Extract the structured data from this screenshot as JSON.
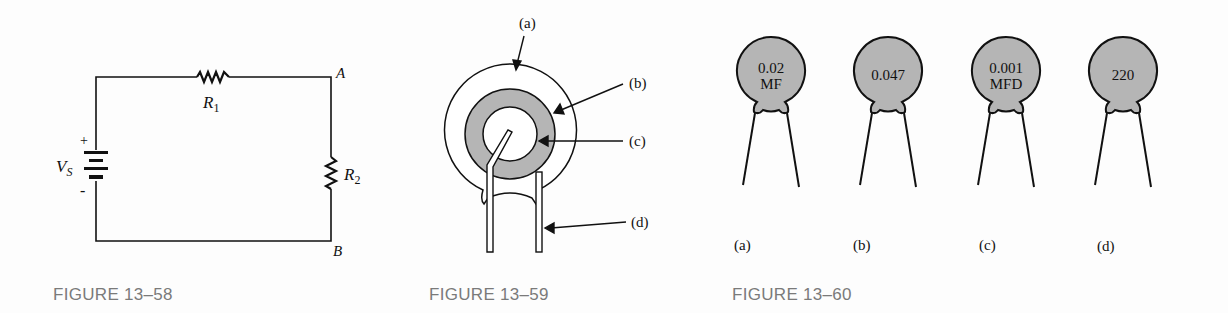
{
  "figures": [
    {
      "caption": "FIGURE 13–58",
      "type": "series circuit",
      "labels": {
        "source": "V",
        "source_sub": "S",
        "plus": "+",
        "minus": "-",
        "r1": "R",
        "r1_sub": "1",
        "r2": "R",
        "r2_sub": "2",
        "node_a": "A",
        "node_b": "B"
      }
    },
    {
      "caption": "FIGURE 13–59",
      "type": "capacitor construction",
      "labels": {
        "a": "(a)",
        "b": "(b)",
        "c": "(c)",
        "d": "(d)"
      }
    },
    {
      "caption": "FIGURE 13–60",
      "type": "ceramic disc capacitors",
      "capacitors": [
        {
          "line1": "0.02",
          "line2": "MF",
          "label": "(a)"
        },
        {
          "line1": "0.047",
          "line2": "",
          "label": "(b)"
        },
        {
          "line1": "0.001",
          "line2": "MFD",
          "label": "(c)"
        },
        {
          "line1": "220",
          "line2": "",
          "label": "(d)"
        }
      ]
    }
  ],
  "colors": {
    "ink": "#111111",
    "fill_gray": "#b5b5b5",
    "caption": "#7a7a7a"
  }
}
